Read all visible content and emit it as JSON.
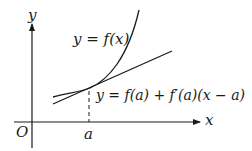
{
  "diagram": {
    "axes": {
      "x_label": "x",
      "y_label": "y",
      "origin_label": "O"
    },
    "point_label": "a",
    "curve_label": "y = f(x)",
    "tangent_label": "y = f(a) + f′(a)(x − a)",
    "colors": {
      "stroke": "#1a1a1a",
      "background": "#ffffff"
    }
  }
}
